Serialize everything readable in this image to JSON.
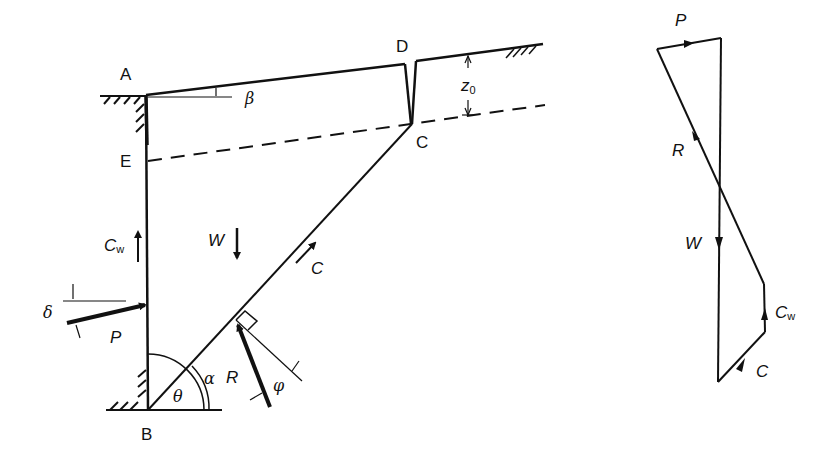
{
  "diagram": {
    "colors": {
      "ink": "#111111",
      "background": "#ffffff"
    },
    "points": {
      "A": {
        "label": "A"
      },
      "B": {
        "label": "B"
      },
      "C": {
        "label": "C"
      },
      "D": {
        "label": "D"
      },
      "E": {
        "label": "E"
      }
    },
    "angles": {
      "beta": "β",
      "alpha": "α",
      "theta": "θ",
      "phi": "φ",
      "delta": "δ"
    },
    "forces": {
      "W": "W",
      "P": "P",
      "R": "R",
      "C": "C",
      "Cw": {
        "main": "C",
        "sub": "w"
      }
    },
    "dimension": {
      "z0": {
        "main": "z",
        "sub": "0"
      }
    },
    "force_polygon": {
      "labels": {
        "P": "P",
        "R": "R",
        "W": "W",
        "Cw": {
          "main": "C",
          "sub": "w"
        },
        "C": "C"
      }
    }
  }
}
